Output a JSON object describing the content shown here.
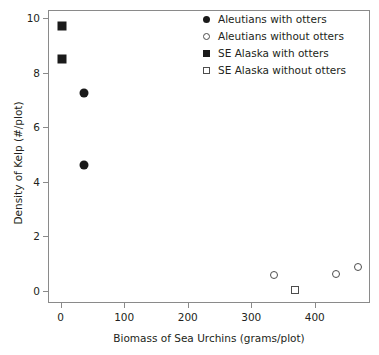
{
  "chart_data": {
    "type": "scatter",
    "title": "",
    "xlabel": "Biomass of Sea Urchins (grams/plot)",
    "ylabel": "Density of Kelp (#/plot)",
    "xlim": [
      -20,
      487
    ],
    "ylim": [
      -0.45,
      10.3
    ],
    "xticks": [
      0,
      100,
      200,
      300,
      400
    ],
    "xticklabels": [
      "0",
      "100",
      "200",
      "300",
      "400"
    ],
    "yticks": [
      0,
      2,
      4,
      6,
      8,
      10
    ],
    "yticklabels": [
      "0",
      "2",
      "4",
      "6",
      "8",
      "10"
    ],
    "grid": false,
    "legend_position": "top-right",
    "series": [
      {
        "name": "Aleutians with otters",
        "marker": "circle-filled",
        "color": "#1a1a1a",
        "points": [
          {
            "x": 35,
            "y": 7.3
          },
          {
            "x": 35,
            "y": 4.65
          }
        ]
      },
      {
        "name": "Aleutians without otters",
        "marker": "circle-open",
        "color": "#4d4d4d",
        "points": [
          {
            "x": 335,
            "y": 0.6
          },
          {
            "x": 432,
            "y": 0.65
          },
          {
            "x": 467,
            "y": 0.9
          }
        ]
      },
      {
        "name": "SE Alaska with otters",
        "marker": "square-filled",
        "color": "#1a1a1a",
        "points": [
          {
            "x": 0,
            "y": 9.75
          },
          {
            "x": 0,
            "y": 8.55
          }
        ]
      },
      {
        "name": "SE Alaska without otters",
        "marker": "square-open",
        "color": "#4d4d4d",
        "points": [
          {
            "x": 368,
            "y": 0.05
          }
        ]
      }
    ]
  }
}
